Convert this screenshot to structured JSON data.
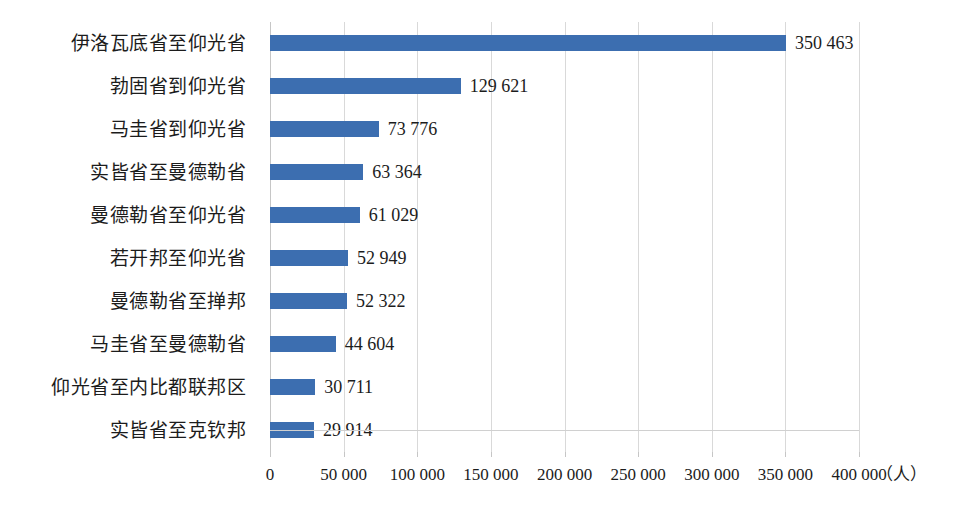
{
  "chart_data": {
    "type": "bar",
    "orientation": "horizontal",
    "title": "",
    "subtitle": "",
    "xlabel": "（人）",
    "ylabel": "",
    "xlim": [
      0,
      400000
    ],
    "xtick_step": 50000,
    "grid": true,
    "legend": false,
    "legend_position": "none",
    "thousands_separator": " ",
    "bar_color": "#3c6eb0",
    "categories": [
      "伊洛瓦底省至仰光省",
      "勃固省到仰光省",
      "马圭省到仰光省",
      "实皆省至曼德勒省",
      "曼德勒省至仰光省",
      "若开邦至仰光省",
      "曼德勒省至掸邦",
      "马圭省至曼德勒省",
      "仰光省至内比都联邦区",
      "实皆省至克钦邦"
    ],
    "values": [
      350463,
      129621,
      73776,
      63364,
      61029,
      52949,
      52322,
      44604,
      30711,
      29914
    ],
    "value_labels": [
      "350 463",
      "129 621",
      "73 776",
      "63 364",
      "61 029",
      "52 949",
      "52 322",
      "44 604",
      "30 711",
      "29 914"
    ],
    "xtick_labels": [
      "0",
      "50 000",
      "100 000",
      "150 000",
      "200 000",
      "250 000",
      "300 000",
      "350 000",
      "400 000"
    ],
    "xtick_values": [
      0,
      50000,
      100000,
      150000,
      200000,
      250000,
      300000,
      350000,
      400000
    ]
  }
}
